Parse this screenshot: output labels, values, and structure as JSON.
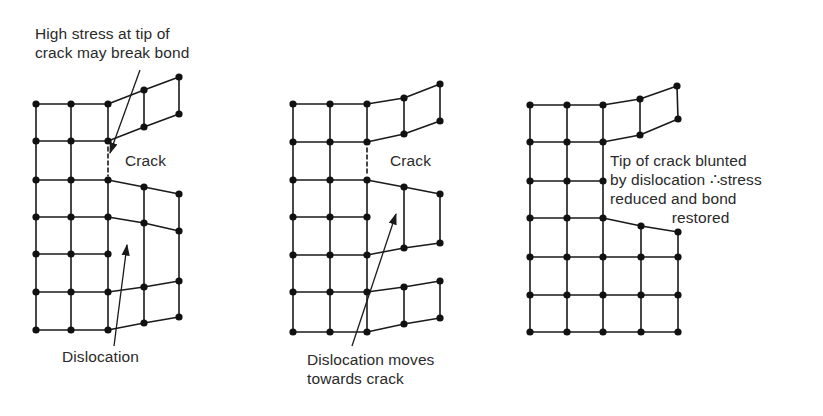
{
  "figure": {
    "panels": [
      {
        "id": "panel-1",
        "labels": {
          "annotation": "High stress at tip of\ncrack may break bond",
          "crack": "Crack",
          "dislocation": "Dislocation"
        },
        "atoms": [
          [
            36,
            104
          ],
          [
            71,
            104
          ],
          [
            108,
            104
          ],
          [
            144,
            90
          ],
          [
            179,
            77
          ],
          [
            36,
            141
          ],
          [
            71,
            141
          ],
          [
            108,
            141
          ],
          [
            144,
            127
          ],
          [
            179,
            114
          ],
          [
            36,
            180
          ],
          [
            71,
            180
          ],
          [
            108,
            180
          ],
          [
            144,
            187
          ],
          [
            179,
            194
          ],
          [
            36,
            217
          ],
          [
            71,
            217
          ],
          [
            108,
            217
          ],
          [
            144,
            223
          ],
          [
            179,
            231
          ],
          [
            36,
            254
          ],
          [
            71,
            254
          ],
          [
            108,
            254
          ],
          [
            36,
            292
          ],
          [
            71,
            292
          ],
          [
            108,
            292
          ],
          [
            144,
            287
          ],
          [
            179,
            281
          ],
          [
            36,
            330
          ],
          [
            71,
            330
          ],
          [
            108,
            330
          ],
          [
            144,
            323
          ],
          [
            179,
            317
          ]
        ],
        "bonds": [
          [
            36,
            104,
            36,
            330
          ],
          [
            71,
            104,
            71,
            330
          ],
          [
            108,
            104,
            108,
            141
          ],
          [
            108,
            180,
            108,
            330
          ],
          [
            144,
            90,
            144,
            127
          ],
          [
            179,
            77,
            179,
            114
          ],
          [
            144,
            187,
            144,
            323
          ],
          [
            179,
            194,
            179,
            317
          ],
          [
            36,
            104,
            108,
            104
          ],
          [
            108,
            104,
            144,
            90
          ],
          [
            144,
            90,
            179,
            77
          ],
          [
            36,
            141,
            108,
            141
          ],
          [
            108,
            141,
            144,
            127
          ],
          [
            144,
            127,
            179,
            114
          ],
          [
            36,
            180,
            108,
            180
          ],
          [
            108,
            180,
            144,
            187
          ],
          [
            144,
            187,
            179,
            194
          ],
          [
            36,
            217,
            108,
            217
          ],
          [
            108,
            217,
            144,
            223
          ],
          [
            144,
            223,
            179,
            231
          ],
          [
            36,
            254,
            108,
            254
          ],
          [
            36,
            292,
            108,
            292
          ],
          [
            108,
            292,
            144,
            287
          ],
          [
            144,
            287,
            179,
            281
          ],
          [
            36,
            330,
            108,
            330
          ],
          [
            108,
            330,
            144,
            323
          ],
          [
            144,
            323,
            179,
            317
          ]
        ],
        "broken_bonds": [
          [
            108,
            147,
            108,
            176
          ]
        ],
        "arrows": [
          {
            "from": [
              140,
              70
            ],
            "to": [
              110,
              153
            ]
          },
          {
            "from": [
              114,
              346
            ],
            "to": [
              127,
              245
            ]
          }
        ]
      },
      {
        "id": "panel-2",
        "labels": {
          "crack": "Crack",
          "dislocation": "Dislocation moves\ntowards crack"
        },
        "atoms": [
          [
            293,
            104
          ],
          [
            330,
            104
          ],
          [
            367,
            104
          ],
          [
            404,
            98
          ],
          [
            440,
            84
          ],
          [
            293,
            142
          ],
          [
            330,
            142
          ],
          [
            367,
            142
          ],
          [
            404,
            134
          ],
          [
            440,
            121
          ],
          [
            293,
            180
          ],
          [
            330,
            180
          ],
          [
            367,
            180
          ],
          [
            404,
            187
          ],
          [
            440,
            194
          ],
          [
            293,
            217
          ],
          [
            330,
            217
          ],
          [
            367,
            217
          ],
          [
            293,
            255
          ],
          [
            330,
            255
          ],
          [
            367,
            255
          ],
          [
            404,
            248
          ],
          [
            440,
            243
          ],
          [
            293,
            292
          ],
          [
            330,
            292
          ],
          [
            367,
            292
          ],
          [
            404,
            287
          ],
          [
            440,
            281
          ],
          [
            293,
            332
          ],
          [
            330,
            332
          ],
          [
            367,
            332
          ],
          [
            404,
            324
          ],
          [
            440,
            318
          ]
        ],
        "bonds": [
          [
            293,
            104,
            293,
            332
          ],
          [
            330,
            104,
            330,
            332
          ],
          [
            367,
            104,
            367,
            142
          ],
          [
            367,
            180,
            367,
            332
          ],
          [
            404,
            98,
            404,
            134
          ],
          [
            440,
            84,
            440,
            121
          ],
          [
            404,
            187,
            404,
            248
          ],
          [
            440,
            194,
            440,
            243
          ],
          [
            404,
            287,
            404,
            324
          ],
          [
            440,
            281,
            440,
            318
          ],
          [
            293,
            104,
            367,
            104
          ],
          [
            367,
            104,
            404,
            98
          ],
          [
            404,
            98,
            440,
            84
          ],
          [
            293,
            142,
            367,
            142
          ],
          [
            367,
            142,
            404,
            134
          ],
          [
            404,
            134,
            440,
            121
          ],
          [
            293,
            180,
            367,
            180
          ],
          [
            367,
            180,
            404,
            187
          ],
          [
            404,
            187,
            440,
            194
          ],
          [
            293,
            217,
            367,
            217
          ],
          [
            293,
            255,
            367,
            255
          ],
          [
            367,
            255,
            404,
            248
          ],
          [
            404,
            248,
            440,
            243
          ],
          [
            293,
            292,
            367,
            292
          ],
          [
            367,
            292,
            404,
            287
          ],
          [
            404,
            287,
            440,
            281
          ],
          [
            293,
            332,
            367,
            332
          ],
          [
            367,
            332,
            404,
            324
          ],
          [
            404,
            324,
            440,
            318
          ]
        ],
        "broken_bonds": [
          [
            367,
            148,
            367,
            176
          ]
        ],
        "arrows": [
          {
            "from": [
              352,
              346
            ],
            "to": [
              396,
              214
            ]
          }
        ]
      },
      {
        "id": "panel-3",
        "labels": {
          "annotation": "Tip of crack blunted\nby dislocation ∴stress\nreduced and bond\n              restored"
        },
        "atoms": [
          [
            530,
            105
          ],
          [
            567,
            105
          ],
          [
            603,
            105
          ],
          [
            640,
            99
          ],
          [
            677,
            86
          ],
          [
            530,
            142
          ],
          [
            567,
            142
          ],
          [
            603,
            142
          ],
          [
            640,
            135
          ],
          [
            678,
            119
          ],
          [
            530,
            181
          ],
          [
            567,
            181
          ],
          [
            603,
            181
          ],
          [
            530,
            218
          ],
          [
            567,
            218
          ],
          [
            603,
            218
          ],
          [
            641,
            226
          ],
          [
            678,
            232
          ],
          [
            530,
            257
          ],
          [
            567,
            257
          ],
          [
            603,
            257
          ],
          [
            641,
            257
          ],
          [
            678,
            257
          ],
          [
            530,
            295
          ],
          [
            567,
            295
          ],
          [
            603,
            295
          ],
          [
            641,
            295
          ],
          [
            678,
            295
          ],
          [
            530,
            332
          ],
          [
            567,
            332
          ],
          [
            603,
            332
          ],
          [
            641,
            332
          ],
          [
            678,
            332
          ]
        ],
        "bonds": [
          [
            530,
            105,
            530,
            332
          ],
          [
            567,
            105,
            567,
            332
          ],
          [
            603,
            105,
            603,
            332
          ],
          [
            640,
            99,
            640,
            135
          ],
          [
            677,
            86,
            678,
            119
          ],
          [
            641,
            226,
            641,
            332
          ],
          [
            678,
            232,
            678,
            332
          ],
          [
            530,
            105,
            603,
            105
          ],
          [
            603,
            105,
            640,
            99
          ],
          [
            640,
            99,
            677,
            86
          ],
          [
            530,
            142,
            603,
            142
          ],
          [
            603,
            142,
            640,
            135
          ],
          [
            640,
            135,
            678,
            119
          ],
          [
            530,
            181,
            603,
            181
          ],
          [
            530,
            218,
            603,
            218
          ],
          [
            603,
            218,
            641,
            226
          ],
          [
            641,
            226,
            678,
            232
          ],
          [
            530,
            257,
            678,
            257
          ],
          [
            530,
            295,
            678,
            295
          ],
          [
            530,
            332,
            678,
            332
          ]
        ],
        "broken_bonds": [],
        "arrows": []
      }
    ],
    "style": {
      "line_color": "#1a1a1a",
      "atom_color": "#111111",
      "text_color": "#2a2a2a",
      "background": "#ffffff",
      "atom_radius": 3.6
    }
  }
}
